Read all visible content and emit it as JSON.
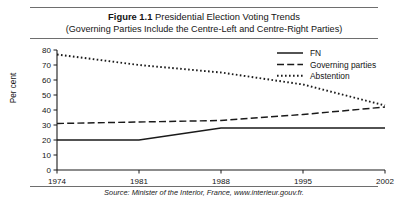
{
  "figure": {
    "number": "Figure 1.1",
    "title_rest": " Presidential Election Voting Trends",
    "subtitle": "(Governing Parties Include the Centre-Left and Centre-Right Parties)",
    "source": "Source: Minister of the Interior, France, www.interieur.gouv.fr."
  },
  "chart_data": {
    "type": "line",
    "title": "Figure 1.1 Presidential Election Voting Trends",
    "subtitle": "(Governing Parties Include the Centre-Left and Centre-Right Parties)",
    "xlabel": "",
    "ylabel": "Per cent",
    "x": [
      1974,
      1981,
      1988,
      1995,
      2002
    ],
    "xtick_labels": [
      "1974",
      "1981",
      "1988",
      "1995",
      "2002"
    ],
    "ytick_labels": [
      "0",
      "10",
      "20",
      "30",
      "40",
      "50",
      "60",
      "70",
      "80"
    ],
    "yticks": [
      0,
      10,
      20,
      30,
      40,
      50,
      60,
      70,
      80
    ],
    "ylim": [
      0,
      80
    ],
    "grid": false,
    "legend_position": "top-right",
    "series": [
      {
        "name": "FN",
        "style": "solid",
        "color": "#1a1a1a",
        "values": [
          20,
          20,
          28,
          28,
          28
        ]
      },
      {
        "name": "Governing parties",
        "style": "dashed",
        "color": "#1a1a1a",
        "values": [
          31,
          32,
          33,
          37,
          42
        ]
      },
      {
        "name": "Abstention",
        "style": "dotted",
        "color": "#1a1a1a",
        "values": [
          77,
          70,
          65,
          57,
          43
        ]
      }
    ]
  }
}
